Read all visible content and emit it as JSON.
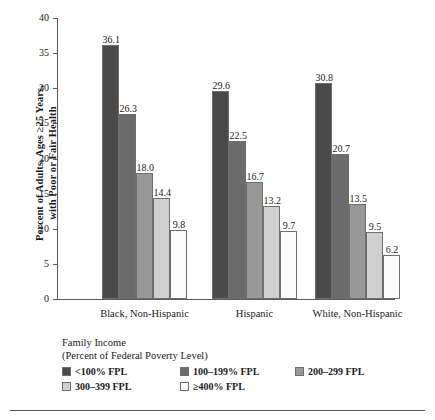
{
  "chart_data": {
    "type": "bar",
    "title": "",
    "xlabel": "Family Income (Percent of Federal Poverty Level)",
    "ylabel": "Percent of Adults, Ages ≥25 Years, with Poor or Fair Health",
    "categories": [
      "Black, Non-Hispanic",
      "Hispanic",
      "White, Non-Hispanic"
    ],
    "series": [
      {
        "name": "<100% FPL",
        "color": "#4a4a4a",
        "values": [
          36.1,
          29.6,
          30.8
        ]
      },
      {
        "name": "100–199% FPL",
        "color": "#6b6b6b",
        "values": [
          26.3,
          22.5,
          20.7
        ]
      },
      {
        "name": "200–299 FPL",
        "color": "#989898",
        "values": [
          18.0,
          16.7,
          13.5
        ]
      },
      {
        "name": "300–399 FPL",
        "color": "#cfcfcf",
        "values": [
          14.4,
          13.2,
          9.5
        ]
      },
      {
        "name": "≥400% FPL",
        "color": "#fbfbfb",
        "values": [
          9.8,
          9.7,
          6.2
        ]
      }
    ],
    "value_labels": [
      [
        "36.1",
        "26.3",
        "18.0",
        "14.4",
        "9.8"
      ],
      [
        "29.6",
        "22.5",
        "16.7",
        "13.2",
        "9.7"
      ],
      [
        "30.8",
        "20.7",
        "13.5",
        "9.5",
        "6.2"
      ]
    ],
    "ylim": [
      0,
      40
    ],
    "yticks": [
      0,
      5,
      10,
      15,
      20,
      25,
      30,
      35,
      40
    ],
    "ytick_labels": [
      "0",
      "5",
      "10",
      "15",
      "20",
      "25",
      "30",
      "35",
      "40"
    ],
    "grid": false,
    "legend_position": "bottom-left"
  },
  "axes": {
    "y_title_line1": "Percent of Adults, Ages ≥25 Years,",
    "y_title_line2": "with Poor or Fair Health"
  },
  "legend": {
    "title_line1": "Family Income",
    "title_line2": "(Percent of Federal Poverty Level)"
  }
}
